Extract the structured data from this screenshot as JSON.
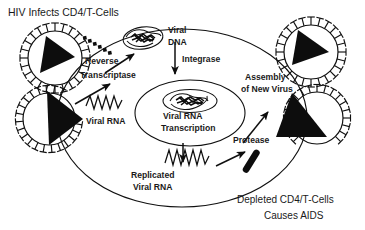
{
  "figure": {
    "title": "HIV Infects CD4/T-Cells",
    "caption_line1": "Depleted CD4/T-Cells",
    "caption_line2": "Causes AIDS",
    "colors": {
      "ink": "#0d0d0d",
      "background": "#ffffff",
      "text": "#1a1a1a"
    }
  },
  "labels": {
    "reverse_transcriptase_line1": "Reverse",
    "reverse_transcriptase_line2": "Transcriptase",
    "viral_rna": "Viral RNA",
    "viral_dna_line1": "Viral",
    "viral_dna_line2": "DNA",
    "integrase": "Integrase",
    "viral_rna_transcription_line1": "Viral RNA",
    "viral_rna_transcription_line2": "Transcription",
    "replicated_rna_line1": "Replicated",
    "replicated_rna_line2": "Viral RNA",
    "protease": "Protease",
    "assembly_line1": "Assembly",
    "assembly_line2": "of New Virus"
  },
  "elements": {
    "virion_free": "hiv-virion-free",
    "virion_fusing": "hiv-virion-fusing",
    "virion_budding": "hiv-virion-budding",
    "virion_released": "hiv-virion-released",
    "host_cell": "cd4-t-cell-membrane",
    "nucleus": "cell-nucleus",
    "reverse_transcriptase_enzyme": "reverse-transcriptase-dotted-chain",
    "viral_dna_complex": "viral-dna-tangle",
    "integrated_provirus": "integrated-provirus-tangle",
    "viral_rna_strand": "viral-rna-zigzag",
    "replicated_rna_strand": "replicated-viral-rna-zigzag",
    "protease_enzyme": "protease-rod"
  }
}
